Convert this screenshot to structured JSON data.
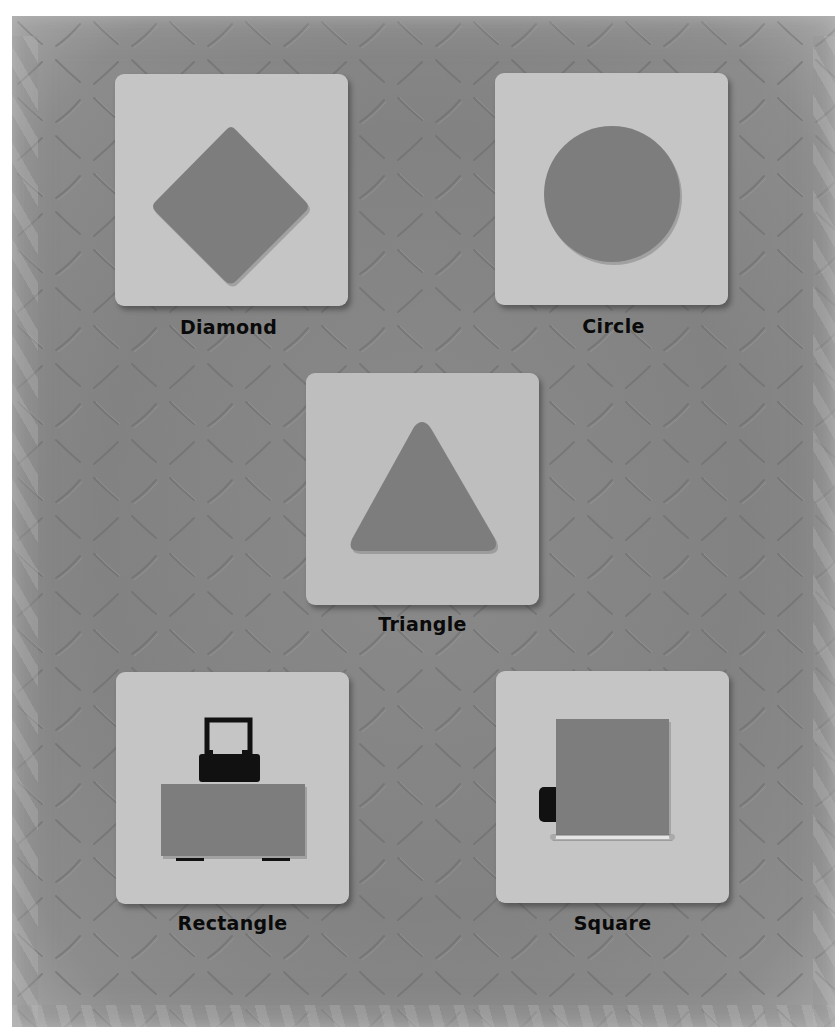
{
  "colors": {
    "background": "#868686",
    "card": "#c5c5c5",
    "shape": "#7d7d7d",
    "label": "#0a0a0a",
    "page_margin": "#ffffff"
  },
  "shapes": [
    {
      "id": "diamond",
      "label": "Diamond",
      "icon": "diamond-shape"
    },
    {
      "id": "circle",
      "label": "Circle",
      "icon": "circle-shape"
    },
    {
      "id": "triangle",
      "label": "Triangle",
      "icon": "triangle-shape"
    },
    {
      "id": "rectangle",
      "label": "Rectangle",
      "icon": "rectangle-sign-on-post-shape"
    },
    {
      "id": "square",
      "label": "Square",
      "icon": "square-sign-on-truck-shape"
    }
  ]
}
